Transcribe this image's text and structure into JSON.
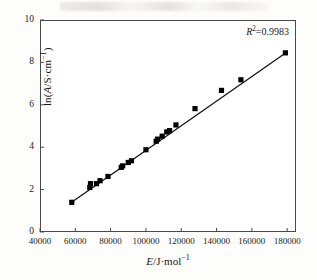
{
  "chart_data": {
    "type": "scatter",
    "title": "",
    "subtitle": "",
    "xlabel": "E/J·mol⁻¹",
    "ylabel": "ln(A/S·cm⁻¹)",
    "xlim": [
      40000,
      185000
    ],
    "ylim": [
      0,
      10
    ],
    "xticks": [
      40000,
      60000,
      80000,
      100000,
      120000,
      140000,
      160000,
      180000
    ],
    "xtick_labels": [
      "40000",
      "60000",
      "80000",
      "100000",
      "120000",
      "140000",
      "160000",
      "180000"
    ],
    "yticks": [
      0,
      2,
      4,
      6,
      8,
      10
    ],
    "ytick_labels": [
      "0",
      "2",
      "4",
      "6",
      "8",
      "10"
    ],
    "grid": false,
    "legend": null,
    "marker": "filled-square",
    "marker_color": "#000000",
    "line_color": "#000000",
    "annotations": [
      {
        "text": "R²=0.9983",
        "x": 178000,
        "y": 9.55,
        "name": "r-squared-annotation"
      }
    ],
    "series": [
      {
        "name": "ln(A) vs E",
        "points": [
          {
            "x": 58000,
            "y": 1.4
          },
          {
            "x": 68200,
            "y": 2.1
          },
          {
            "x": 68600,
            "y": 2.28
          },
          {
            "x": 72000,
            "y": 2.28
          },
          {
            "x": 74000,
            "y": 2.42
          },
          {
            "x": 78500,
            "y": 2.62
          },
          {
            "x": 86000,
            "y": 3.05
          },
          {
            "x": 86800,
            "y": 3.12
          },
          {
            "x": 90000,
            "y": 3.28
          },
          {
            "x": 91800,
            "y": 3.36
          },
          {
            "x": 100000,
            "y": 3.88
          },
          {
            "x": 105800,
            "y": 4.28
          },
          {
            "x": 106600,
            "y": 4.38
          },
          {
            "x": 109200,
            "y": 4.52
          },
          {
            "x": 111800,
            "y": 4.72
          },
          {
            "x": 113400,
            "y": 4.78
          },
          {
            "x": 117000,
            "y": 5.05
          },
          {
            "x": 127800,
            "y": 5.82
          },
          {
            "x": 142800,
            "y": 6.68
          },
          {
            "x": 153800,
            "y": 7.18
          },
          {
            "x": 179000,
            "y": 8.45
          }
        ]
      }
    ],
    "fit_line": {
      "name": "linear-regression-line",
      "r_squared": 0.9983,
      "x_start": 57500,
      "y_start": 1.38,
      "x_end": 179500,
      "y_end": 8.47
    }
  }
}
